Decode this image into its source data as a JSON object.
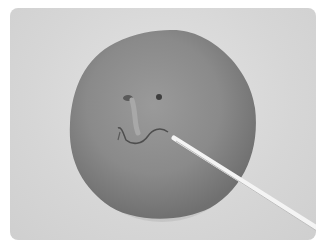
{
  "image": {
    "description": "Grayscale photo of a flattened clay disc with a sculpted face (two eye holes, nose, mouth) being shaped by a white stick tool",
    "colors": {
      "background": "#ffffff",
      "surface": "#d8d8d8",
      "clay": "#8a8a8a",
      "clay_shadow": "#6e6e6e",
      "tool": "#f2f2f2"
    }
  }
}
